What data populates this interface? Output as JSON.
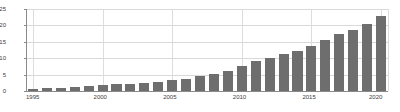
{
  "chart_data": {
    "type": "bar",
    "title": "",
    "subtitle": "",
    "xlabel": "",
    "ylabel": "",
    "categories": [
      "1995",
      "1996",
      "1997",
      "1998",
      "1999",
      "2000",
      "2001",
      "2002",
      "2003",
      "2004",
      "2005",
      "2006",
      "2007",
      "2008",
      "2009",
      "2010",
      "2011",
      "2012",
      "2013",
      "2014",
      "2015",
      "2016",
      "2017",
      "2018",
      "2019",
      "2020"
    ],
    "values": [
      0.5,
      0.8,
      1.0,
      1.2,
      1.4,
      1.7,
      2.0,
      2.2,
      2.5,
      2.8,
      3.2,
      3.7,
      4.4,
      5.2,
      6.2,
      7.6,
      9.0,
      10.0,
      11.2,
      12.2,
      13.6,
      15.6,
      17.3,
      18.6,
      20.4,
      22.8
    ],
    "series": [
      {
        "name": "Series 1",
        "values": [
          0.5,
          0.8,
          1.0,
          1.2,
          1.4,
          1.7,
          2.0,
          2.2,
          2.5,
          2.8,
          3.2,
          3.7,
          4.4,
          5.2,
          6.2,
          7.6,
          9.0,
          10.0,
          11.2,
          12.2,
          13.6,
          15.6,
          17.3,
          18.6,
          20.4,
          22.8
        ],
        "color": "#6e6e6e"
      }
    ],
    "ylim": [
      0,
      25
    ],
    "yticks": [
      0,
      5,
      10,
      15,
      20,
      25
    ],
    "ytick_labels": [
      "0",
      "5",
      "10",
      "15",
      "20",
      "25"
    ],
    "xtick_labels": [
      "1995",
      "2000",
      "2005",
      "2010",
      "2015",
      "2020"
    ],
    "xtick_values": [
      1995,
      2000,
      2005,
      2010,
      2015,
      2020
    ],
    "xlim": [
      1994.5,
      2020.5
    ],
    "grid": {
      "horizontal": true,
      "vertical": true,
      "color": "#d9d9d9"
    },
    "legend": {
      "visible": false,
      "position": "none",
      "entries": []
    },
    "bar_color": "#6e6e6e",
    "axis_color": "#8a8a8a",
    "background": "#ffffff",
    "annotations": []
  }
}
